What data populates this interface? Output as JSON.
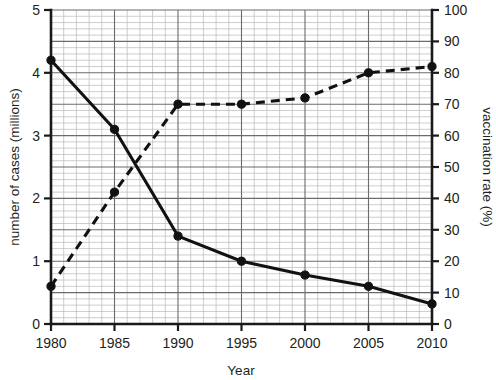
{
  "chart_data": {
    "type": "line",
    "title": "",
    "subtitle": "",
    "xlabel": "Year",
    "ylabel": "number of cases (millions)",
    "y2label": "vaccination rate (%)",
    "x": [
      1980,
      1985,
      1990,
      1995,
      2000,
      2005,
      2010
    ],
    "xlim": [
      1980,
      2010
    ],
    "ylim": [
      0,
      5
    ],
    "y2lim": [
      0,
      100
    ],
    "xticks": [
      "1980",
      "1985",
      "1990",
      "1995",
      "2000",
      "2005",
      "2010"
    ],
    "yticks": [
      "0",
      "1",
      "2",
      "3",
      "4",
      "5"
    ],
    "y2ticks": [
      "0",
      "10",
      "20",
      "30",
      "40",
      "50",
      "60",
      "70",
      "80",
      "90",
      "100"
    ],
    "grid": true,
    "grid_minor": true,
    "legend": "none",
    "series": [
      {
        "name": "number of cases (millions)",
        "axis": "left",
        "style": "solid",
        "marker": "filled-circle",
        "values": [
          4.2,
          3.1,
          1.4,
          1.0,
          0.78,
          0.6,
          0.32
        ]
      },
      {
        "name": "vaccination rate (%)",
        "axis": "right",
        "style": "dashed",
        "marker": "filled-circle",
        "values": [
          12,
          42,
          70,
          70,
          72,
          80,
          82
        ]
      }
    ]
  },
  "axes": {
    "left_title": "number of cases (millions)",
    "right_title": "vaccination rate (%)",
    "bottom_title": "Year"
  },
  "colors": {
    "line": "#111111",
    "major_grid": "#6b6b6b",
    "minor_grid": "#b9b9b9",
    "axis": "#1a1a1a",
    "background": "#ffffff",
    "text": "#231f20"
  }
}
